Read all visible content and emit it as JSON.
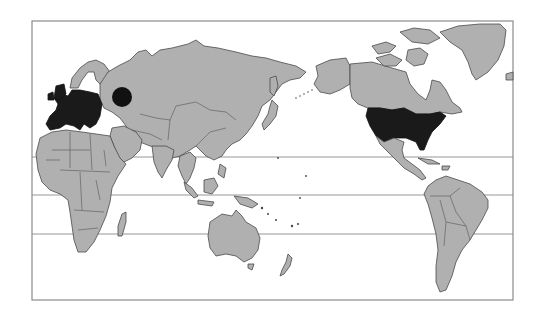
{
  "map": {
    "projection": "pacific-centered world map",
    "style": "grayscale",
    "colors": {
      "background": "#ffffff",
      "land": "#b0b0b0",
      "land_outline": "#4a4a4a",
      "highlighted": "#1a1a1a",
      "frame": "#8a8a8a"
    },
    "frame": {
      "x": 32,
      "y": 21,
      "width": 481,
      "height": 279
    },
    "latitude_lines": [
      {
        "name": "tropic-of-cancer",
        "y": 157
      },
      {
        "name": "equator",
        "y": 195
      },
      {
        "name": "tropic-of-capricorn",
        "y": 234
      }
    ],
    "highlighted_regions": [
      {
        "name": "western-europe",
        "fill": "#1a1a1a"
      },
      {
        "name": "united-states",
        "fill": "#1a1a1a"
      }
    ],
    "markers": [
      {
        "name": "russia-dot",
        "shape": "circle",
        "cx": 122,
        "cy": 97,
        "r": 10,
        "fill": "#111111"
      }
    ]
  }
}
